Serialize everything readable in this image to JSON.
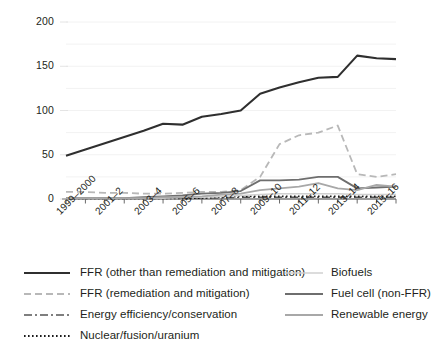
{
  "chart_data": {
    "type": "line",
    "title": "",
    "subtitle": "",
    "xlabel": "",
    "ylabel": "",
    "grid": true,
    "legend_position": "bottom",
    "ylim": [
      0,
      200
    ],
    "yticks": [
      0,
      50,
      100,
      150,
      200
    ],
    "ytick_labels": [
      "0",
      "50",
      "100",
      "150",
      "200"
    ],
    "categories": [
      "1999–2000",
      "2000–1",
      "2001–2",
      "2002–3",
      "2003–4",
      "2004–5",
      "2005–6",
      "2006–7",
      "2007–8",
      "2008–9",
      "2009–10",
      "2010–11",
      "2011–12",
      "2012–13",
      "2013–14",
      "2014–15",
      "2015–16",
      "2016–17"
    ],
    "xtick_labels": [
      "1999–2000",
      "2001–2",
      "2003–4",
      "2005–6",
      "2007–8",
      "2009–10",
      "2011–12",
      "2013–14",
      "2015–16"
    ],
    "series": [
      {
        "name": "FFR (other than remediation and mitigation)",
        "style": "solid",
        "color": "#2f2f2f",
        "width": 2.1,
        "values": [
          49,
          56,
          63,
          70,
          77,
          85,
          84,
          93,
          96,
          100,
          119,
          126,
          132,
          137,
          138,
          162,
          159,
          158
        ]
      },
      {
        "name": "FFR (remediation and mitigation)",
        "style": "dashed",
        "color": "#b8b8b8",
        "width": 1.8,
        "values": [
          8,
          8,
          7,
          7,
          6,
          6,
          7,
          8,
          8,
          10,
          25,
          62,
          72,
          75,
          83,
          28,
          25,
          28
        ]
      },
      {
        "name": "Energy efficiency/conservation",
        "style": "dashdot",
        "color": "#555555",
        "width": 1.3,
        "values": [
          1,
          1,
          1,
          1,
          1,
          1,
          1,
          1,
          1,
          2,
          2,
          2,
          2,
          2,
          2,
          2,
          2,
          2
        ]
      },
      {
        "name": "Nuclear/fusion/uranium",
        "style": "dotted",
        "color": "#1a1a1a",
        "width": 1.6,
        "values": [
          0.5,
          0.5,
          0.5,
          0.5,
          0.5,
          0.5,
          0.5,
          1,
          2,
          3,
          3,
          3,
          3,
          3,
          3,
          3,
          3,
          3
        ]
      },
      {
        "name": "Biofuels",
        "style": "solid",
        "color": "#d0d0d0",
        "width": 1.6,
        "values": [
          1,
          1,
          1,
          1,
          1,
          1,
          2,
          2,
          3,
          4,
          5,
          6,
          6,
          6,
          6,
          5,
          5,
          5
        ]
      },
      {
        "name": "Fuel cell (non-FFR)",
        "style": "solid",
        "color": "#6e6e6e",
        "width": 1.8,
        "values": [
          1,
          1,
          1,
          1,
          2,
          3,
          4,
          6,
          7,
          9,
          21,
          21,
          22,
          25,
          25,
          12,
          13,
          14
        ]
      },
      {
        "name": "Renewable energy",
        "style": "solid",
        "color": "#a8a8a8",
        "width": 1.8,
        "values": [
          1,
          1,
          1,
          1,
          1,
          2,
          2,
          3,
          5,
          6,
          10,
          12,
          14,
          18,
          12,
          10,
          16,
          14
        ]
      }
    ]
  },
  "axis": {
    "y_labels": [
      "200",
      "150",
      "100",
      "50",
      "0"
    ],
    "x_labels": [
      "1999–2000",
      "2001–2",
      "2003–4",
      "2005–6",
      "2007–8",
      "2009–10",
      "2011–12",
      "2013–14",
      "2015–16"
    ]
  },
  "legend": {
    "left_column": [
      {
        "label": "FFR (other than remediation and mitigation)",
        "style": "solid",
        "color": "#2f2f2f",
        "width": 2.1
      },
      {
        "label": "FFR (remediation and mitigation)",
        "style": "dashed",
        "color": "#b8b8b8",
        "width": 1.8
      },
      {
        "label": "Energy efficiency/conservation",
        "style": "dashdot",
        "color": "#555555",
        "width": 1.4
      },
      {
        "label": "Nuclear/fusion/uranium",
        "style": "dotted",
        "color": "#1a1a1a",
        "width": 1.8
      }
    ],
    "right_column": [
      {
        "label": "Biofuels",
        "style": "solid",
        "color": "#d0d0d0",
        "width": 1.6
      },
      {
        "label": "Fuel cell (non-FFR)",
        "style": "solid",
        "color": "#6e6e6e",
        "width": 1.9
      },
      {
        "label": "Renewable energy",
        "style": "solid",
        "color": "#a8a8a8",
        "width": 1.9
      }
    ]
  }
}
